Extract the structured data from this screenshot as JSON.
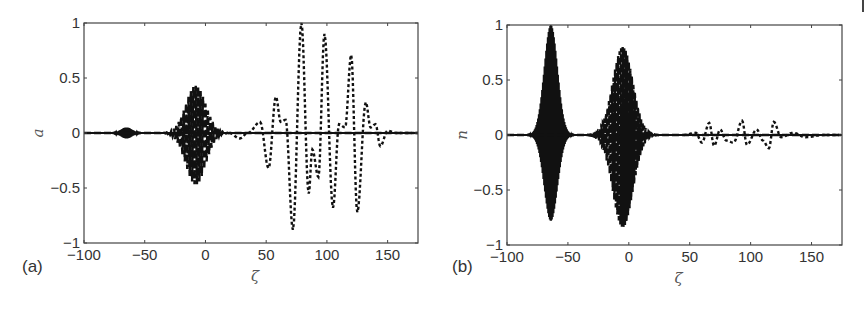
{
  "figure": {
    "corner_mark": "|"
  },
  "chart_data": [
    {
      "type": "line",
      "panel_label": "(a)",
      "title": "",
      "xlabel": "ζ",
      "ylabel": "a",
      "xlim": [
        -100,
        175
      ],
      "ylim": [
        -1,
        1
      ],
      "xticks": [
        -100,
        -50,
        0,
        50,
        100,
        150
      ],
      "xtick_labels": [
        "−100",
        "−50",
        "0",
        "50",
        "100",
        "150"
      ],
      "yticks": [
        -1,
        -0.5,
        0,
        0.5,
        1
      ],
      "ytick_labels": [
        "−1",
        "−0.5",
        "0",
        "0.5",
        "1"
      ],
      "grid": false,
      "legend": null,
      "series": [
        {
          "name": "solid (dense small packet)",
          "style": "solid",
          "envelope": {
            "center": -65,
            "width": 5,
            "amp_pos": 0.05,
            "amp_neg": 0.05,
            "freq": 3.0
          },
          "description": "narrow dense oscillation near ζ≈-65, amplitude ≈0.05"
        },
        {
          "name": "dash-dot (middle packet)",
          "style": "longdash",
          "envelope": {
            "center": -8,
            "width": 9,
            "amp_pos": 0.43,
            "amp_neg": 0.47,
            "freq": 1.0
          },
          "description": "wave packet near ζ≈-8, peaks ≈+0.43 / ≈-0.47"
        },
        {
          "name": "dotted (large packet)",
          "style": "dotted",
          "points": [
            [
              20,
              0.0
            ],
            [
              28,
              -0.05
            ],
            [
              35,
              0.0
            ],
            [
              45,
              0.1
            ],
            [
              52,
              -0.32
            ],
            [
              58,
              0.33
            ],
            [
              62,
              0.1
            ],
            [
              66,
              0.12
            ],
            [
              72,
              -0.88
            ],
            [
              79,
              1.0
            ],
            [
              85,
              -0.55
            ],
            [
              88,
              -0.15
            ],
            [
              93,
              -0.4
            ],
            [
              98,
              0.9
            ],
            [
              105,
              -0.68
            ],
            [
              110,
              0.08
            ],
            [
              115,
              0.05
            ],
            [
              120,
              0.71
            ],
            [
              125,
              -0.72
            ],
            [
              132,
              0.28
            ],
            [
              136,
              0.05
            ],
            [
              140,
              0.08
            ],
            [
              144,
              -0.12
            ],
            [
              150,
              0.02
            ],
            [
              157,
              0.0
            ],
            [
              175,
              0.0
            ]
          ],
          "description": "oscillating packet ζ≈50–150; extremes ≈+1.0 at ζ≈79, ≈-0.88 at ζ≈72"
        }
      ]
    },
    {
      "type": "line",
      "panel_label": "(b)",
      "title": "",
      "xlabel": "ζ",
      "ylabel": "n",
      "xlim": [
        -100,
        175
      ],
      "ylim": [
        -1,
        1
      ],
      "xticks": [
        -100,
        -50,
        0,
        50,
        100,
        150
      ],
      "xtick_labels": [
        "−100",
        "−50",
        "0",
        "50",
        "100",
        "150"
      ],
      "yticks": [
        -1,
        -0.5,
        0,
        0.5,
        1
      ],
      "ytick_labels": [
        "−1",
        "−0.5",
        "0",
        "0.5",
        "1"
      ],
      "grid": false,
      "legend": null,
      "series": [
        {
          "name": "solid (dense large packet)",
          "style": "solid",
          "envelope": {
            "center": -64,
            "width": 6,
            "amp_pos": 1.0,
            "amp_neg": 0.78,
            "freq": 3.0
          },
          "description": "very dense oscillation ζ≈-80 to -50, peak +1.0 at ζ≈-64, min ≈-0.78"
        },
        {
          "name": "dashed (middle packet)",
          "style": "longdash",
          "envelope": {
            "center": -5,
            "width": 9,
            "amp_pos": 0.84,
            "amp_neg": 0.88,
            "freq": 1.6
          },
          "description": "packet ζ≈-30 to 15, peak ≈+0.84, min ≈-0.88"
        },
        {
          "name": "dotted (small packet)",
          "style": "dotted",
          "points": [
            [
              45,
              0.0
            ],
            [
              55,
              0.02
            ],
            [
              60,
              -0.07
            ],
            [
              66,
              0.11
            ],
            [
              70,
              -0.1
            ],
            [
              75,
              0.05
            ],
            [
              80,
              -0.05
            ],
            [
              86,
              -0.07
            ],
            [
              93,
              0.13
            ],
            [
              97,
              -0.09
            ],
            [
              105,
              0.05
            ],
            [
              110,
              -0.05
            ],
            [
              115,
              -0.12
            ],
            [
              119,
              0.12
            ],
            [
              125,
              -0.02
            ],
            [
              135,
              0.02
            ],
            [
              145,
              -0.02
            ],
            [
              160,
              0.0
            ],
            [
              175,
              0.0
            ]
          ],
          "description": "small oscillations ζ≈50–130, amplitude ≈0.1"
        }
      ]
    }
  ]
}
